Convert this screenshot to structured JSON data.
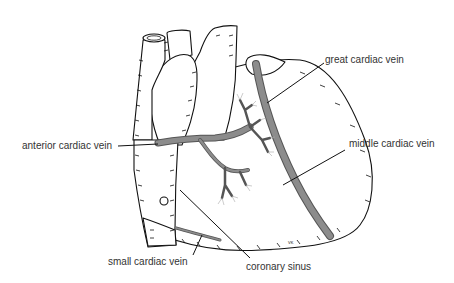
{
  "diagram": {
    "labels": {
      "great_cardiac_vein": "great cardiac vein",
      "anterior_cardiac_vein": "anterior cardiac vein",
      "middle_cardiac_vein": "middle cardiac vein",
      "small_cardiac_vein": "small cardiac vein",
      "coronary_sinus": "coronary sinus"
    },
    "signature": "VK",
    "colors": {
      "outline": "#111111",
      "vein_anterior": "#8c8c8c",
      "vein_anterior_edge": "#555555",
      "vein_posterior": "#d4d4d4",
      "label_text": "#333333",
      "background": "#ffffff"
    }
  }
}
